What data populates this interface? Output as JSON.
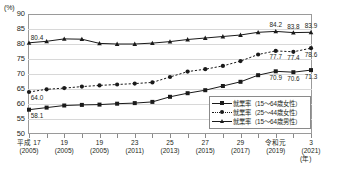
{
  "chart_data": {
    "type": "line",
    "title": "",
    "xlabel": "(年)",
    "ylabel": "",
    "unit": "(%)",
    "ylim": [
      50,
      90
    ],
    "ytick_step": 5,
    "yticks": [
      90,
      85,
      80,
      75,
      70,
      65,
      60,
      55,
      50
    ],
    "grid": true,
    "legend_position": "bottom-right",
    "x": [
      2005,
      2006,
      2007,
      2008,
      2009,
      2010,
      2011,
      2012,
      2013,
      2014,
      2015,
      2016,
      2017,
      2018,
      2019,
      2020,
      2021
    ],
    "xtick_labels": [
      {
        "era": "平成 17",
        "ce": "(2005)"
      },
      {
        "era": "19",
        "ce": "(2005)"
      },
      {
        "era": "19",
        "ce": "(2005)"
      },
      {
        "era": "23",
        "ce": "(2011)"
      },
      {
        "era": "25",
        "ce": "(2013)"
      },
      {
        "era": "27",
        "ce": "(2015)"
      },
      {
        "era": "29",
        "ce": "(2017)"
      },
      {
        "era": "令和元",
        "ce": "(2019)"
      },
      {
        "era": "3",
        "ce": "(2021)"
      }
    ],
    "series": [
      {
        "name": "就業率（15～64歳女性）",
        "marker": "square",
        "line": "solid",
        "values": [
          58.1,
          58.8,
          59.5,
          59.7,
          59.8,
          60.1,
          60.3,
          60.7,
          62.4,
          63.6,
          64.6,
          66.0,
          67.4,
          69.6,
          70.9,
          70.6,
          71.3
        ],
        "labels": [
          {
            "index": 0,
            "value": "58.1"
          },
          {
            "index": 14,
            "value": "70.9"
          },
          {
            "index": 15,
            "value": "70.6"
          },
          {
            "index": 16,
            "value": "71.3"
          }
        ]
      },
      {
        "name": "就業率（25～44歳女性）",
        "marker": "circle",
        "line": "dotted",
        "values": [
          64.0,
          64.9,
          65.3,
          65.8,
          66.2,
          66.5,
          66.8,
          67.2,
          69.0,
          70.8,
          71.6,
          72.7,
          74.3,
          76.5,
          77.7,
          77.4,
          78.6
        ],
        "labels": [
          {
            "index": 0,
            "value": "64.0"
          },
          {
            "index": 14,
            "value": "77.7"
          },
          {
            "index": 15,
            "value": "77.4"
          },
          {
            "index": 16,
            "value": "78.6"
          }
        ]
      },
      {
        "name": "就業率（15～64歳男性）",
        "marker": "triangle",
        "line": "solid",
        "values": [
          80.4,
          80.9,
          81.7,
          81.6,
          80.2,
          80.0,
          80.0,
          80.3,
          80.8,
          81.5,
          82.0,
          82.5,
          83.0,
          83.9,
          84.2,
          83.8,
          83.9
        ],
        "labels": [
          {
            "index": 0,
            "value": "80.4"
          },
          {
            "index": 14,
            "value": "84.2"
          },
          {
            "index": 15,
            "value": "83.8"
          },
          {
            "index": 16,
            "value": "83.9"
          }
        ]
      }
    ]
  }
}
